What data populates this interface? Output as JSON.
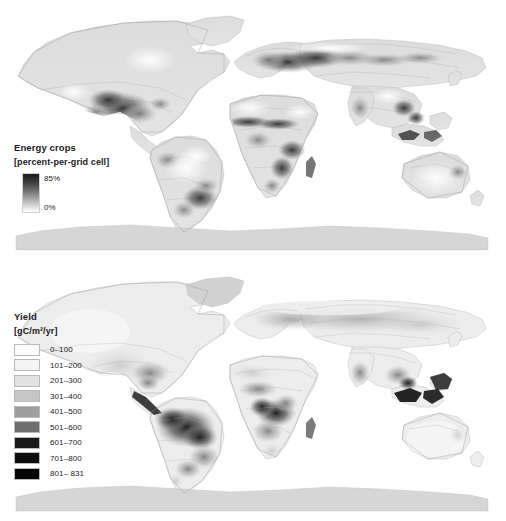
{
  "figure": {
    "background": "#ffffff",
    "projection": "robinson-world",
    "panel_count": 2
  },
  "panels": [
    {
      "id": "energy-crops",
      "legend": {
        "title": "Energy crops",
        "units": "[percent-per-grid cell]",
        "type": "continuous-gradient",
        "high_label": "85%",
        "low_label": "0%",
        "ramp_top_color": "#1c1c1c",
        "ramp_bottom_color": "#fdfdfd"
      }
    },
    {
      "id": "yield",
      "legend": {
        "title": "Yield",
        "units": "[gC/m²/yr]",
        "type": "classed-swatches",
        "classes": [
          {
            "label": "0–100",
            "color": "#fbfbfb"
          },
          {
            "label": "101–200",
            "color": "#f4f4f4"
          },
          {
            "label": "201–300",
            "color": "#e2e2e2"
          },
          {
            "label": "301–400",
            "color": "#c6c6c6"
          },
          {
            "label": "401–500",
            "color": "#9e9e9e"
          },
          {
            "label": "501–600",
            "color": "#6e6e6e"
          },
          {
            "label": "601–700",
            "color": "#1a1a1a"
          },
          {
            "label": "701–800",
            "color": "#0d0d0d"
          },
          {
            "label": "801– 831",
            "color": "#050505"
          }
        ]
      }
    }
  ],
  "chart_data": {
    "type": "heatmap",
    "maps": [
      {
        "name": "Energy crops",
        "variable": "energy crop area",
        "unit": "percent-per-grid cell",
        "scale": "continuous",
        "vmin": 0,
        "vmax": 85,
        "tick_labels": [
          "0%",
          "85%"
        ],
        "colormap": "greys-reversed",
        "notable_high_regions": [
          "US Midwest / Corn Belt",
          "Eastern Europe and Ukraine",
          "Sahel belt of West Africa",
          "Central and Southern Africa",
          "Southeastern Brazil",
          "Southeast Asia"
        ]
      },
      {
        "name": "Yield",
        "variable": "biomass yield",
        "unit": "gC/m²/yr",
        "scale": "classed",
        "vmin": 0,
        "vmax": 831,
        "class_breaks": [
          0,
          100,
          200,
          300,
          400,
          500,
          600,
          700,
          800,
          831
        ],
        "class_labels": [
          "0–100",
          "101–200",
          "201–300",
          "301–400",
          "401–500",
          "501–600",
          "601–700",
          "701–800",
          "801– 831"
        ],
        "colormap": "greys",
        "notable_high_regions": [
          "Amazon Basin",
          "Congo Basin",
          "Indonesia and Malaysia",
          "Southeastern Brazil"
        ]
      }
    ],
    "grid": false,
    "legend_position": "inside-left"
  }
}
